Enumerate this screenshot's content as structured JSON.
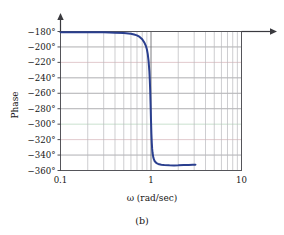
{
  "figure": {
    "caption": "(b)"
  },
  "chart_data": {
    "type": "line",
    "title": "",
    "xlabel": "ω (rad/sec)",
    "ylabel": "Phase",
    "xscale": "log",
    "xlim": [
      0.1,
      10
    ],
    "ylim": [
      -360,
      -180
    ],
    "grid": true,
    "legend": null,
    "x_tick_labels": [
      "0.1",
      "1",
      "10"
    ],
    "x_tick_values": [
      0.1,
      1,
      10
    ],
    "y_tick_labels": [
      "−180°",
      "−200°",
      "−220°",
      "−240°",
      "−260°",
      "−280°",
      "−300°",
      "−320°",
      "−340°",
      "−360°"
    ],
    "y_tick_values": [
      -180,
      -200,
      -220,
      -240,
      -260,
      -280,
      -300,
      -320,
      -340,
      -360
    ],
    "series": [
      {
        "name": "Phase",
        "color": "#2a3f8f",
        "x": [
          0.1,
          0.15,
          0.2,
          0.3,
          0.4,
          0.5,
          0.6,
          0.65,
          0.7,
          0.75,
          0.8,
          0.85,
          0.88,
          0.9,
          0.92,
          0.94,
          0.96,
          0.97,
          0.98,
          0.99,
          1.0,
          1.01,
          1.02,
          1.03,
          1.04,
          1.06,
          1.08,
          1.1,
          1.15,
          1.2,
          1.3,
          1.4,
          1.6,
          1.8,
          2.0,
          2.3,
          2.6,
          2.9,
          3.1
        ],
        "y": [
          -181,
          -181,
          -181,
          -181,
          -181.5,
          -182,
          -183,
          -184,
          -185,
          -187,
          -190,
          -195,
          -199,
          -203,
          -209,
          -218,
          -232,
          -243,
          -257,
          -275,
          -295,
          -312,
          -324,
          -332,
          -337,
          -343,
          -346,
          -348,
          -350.5,
          -351.5,
          -352.5,
          -353,
          -353.3,
          -353.4,
          -353.3,
          -353,
          -352.8,
          -352.5,
          -352.4
        ]
      }
    ],
    "annotations": {
      "reference_arrow_level": -180,
      "reference_arrow_description": "horizontal arrow at −180° extending right beyond plot frame"
    }
  },
  "axes": {
    "y_axis_label": "Phase",
    "x_axis_label": "ω (rad/sec)"
  },
  "ticks": {
    "y": [
      {
        "label": "−180°",
        "value": -180
      },
      {
        "label": "−200°",
        "value": -200
      },
      {
        "label": "−220°",
        "value": -220
      },
      {
        "label": "−240°",
        "value": -240
      },
      {
        "label": "−260°",
        "value": -260
      },
      {
        "label": "−280°",
        "value": -280
      },
      {
        "label": "−300°",
        "value": -300
      },
      {
        "label": "−320°",
        "value": -320
      },
      {
        "label": "−340°",
        "value": -340
      },
      {
        "label": "−360°",
        "value": -360
      }
    ],
    "x": [
      {
        "label": "0.1",
        "value": 0.1
      },
      {
        "label": "1",
        "value": 1
      },
      {
        "label": "10",
        "value": 10
      }
    ]
  }
}
